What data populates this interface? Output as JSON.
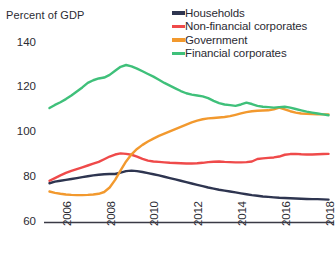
{
  "chart_data": {
    "type": "line",
    "title": "",
    "ylabel": "Percent of GDP",
    "xlabel": "",
    "ylim": [
      60,
      145
    ],
    "xlim": [
      2005.5,
      2018.75
    ],
    "yticks": [
      60,
      80,
      100,
      120,
      140
    ],
    "ytick_labels": [
      "60",
      "80",
      "100",
      "120",
      "140"
    ],
    "xticks": [
      2006,
      2008,
      2010,
      2012,
      2014,
      2016,
      2018
    ],
    "xtick_labels": [
      "2006",
      "2008",
      "2010",
      "2012",
      "2014",
      "2016",
      "2018"
    ],
    "grid": false,
    "legend_position": "top-right",
    "x": [
      2005.75,
      2006.0,
      2006.25,
      2006.5,
      2006.75,
      2007.0,
      2007.25,
      2007.5,
      2007.75,
      2008.0,
      2008.25,
      2008.5,
      2008.75,
      2009.0,
      2009.25,
      2009.5,
      2009.75,
      2010.0,
      2010.25,
      2010.5,
      2010.75,
      2011.0,
      2011.25,
      2011.5,
      2011.75,
      2012.0,
      2012.25,
      2012.5,
      2012.75,
      2013.0,
      2013.25,
      2013.5,
      2013.75,
      2014.0,
      2014.25,
      2014.5,
      2014.75,
      2015.0,
      2015.25,
      2015.5,
      2015.75,
      2016.0,
      2016.25,
      2016.5,
      2016.75,
      2017.0,
      2017.25,
      2017.5,
      2017.75,
      2018.0,
      2018.25,
      2018.5
    ],
    "series": [
      {
        "name": "Households",
        "color": "#2e3550",
        "values": [
          77.5,
          78.2,
          78.6,
          79.0,
          79.4,
          79.8,
          80.2,
          80.6,
          81.0,
          81.3,
          81.5,
          81.6,
          81.6,
          82.2,
          82.9,
          83.1,
          82.9,
          82.5,
          82.0,
          81.5,
          81.0,
          80.4,
          79.8,
          79.2,
          78.6,
          78.0,
          77.4,
          76.8,
          76.2,
          75.6,
          75.1,
          74.6,
          74.2,
          73.8,
          73.4,
          73.0,
          72.6,
          72.2,
          71.9,
          71.6,
          71.4,
          71.2,
          71.0,
          70.9,
          70.8,
          70.7,
          70.6,
          70.5,
          70.4,
          70.4,
          70.3,
          70.2
        ]
      },
      {
        "name": "Non-financial corporates",
        "color": "#ef4a4a",
        "values": [
          78.6,
          79.8,
          81.0,
          82.1,
          83.0,
          83.8,
          84.6,
          85.4,
          86.2,
          87.0,
          88.2,
          89.4,
          90.3,
          90.8,
          90.6,
          90.2,
          89.4,
          88.4,
          87.6,
          87.2,
          87.0,
          86.8,
          86.6,
          86.5,
          86.4,
          86.3,
          86.3,
          86.4,
          86.6,
          86.9,
          87.1,
          87.2,
          87.0,
          86.9,
          86.8,
          86.8,
          86.9,
          87.2,
          88.3,
          88.6,
          88.8,
          89.0,
          89.4,
          90.2,
          90.5,
          90.6,
          90.4,
          90.3,
          90.3,
          90.4,
          90.5,
          90.6
        ]
      },
      {
        "name": "Government",
        "color": "#f2992e",
        "values": [
          73.8,
          73.2,
          72.8,
          72.5,
          72.3,
          72.2,
          72.2,
          72.3,
          72.5,
          72.8,
          73.6,
          75.6,
          79.0,
          83.2,
          87.2,
          90.4,
          92.8,
          94.6,
          96.1,
          97.4,
          98.6,
          99.6,
          100.6,
          101.6,
          102.6,
          103.6,
          104.6,
          105.4,
          106.0,
          106.4,
          106.6,
          106.8,
          107.0,
          107.4,
          108.0,
          108.6,
          109.2,
          109.6,
          109.8,
          109.9,
          110.0,
          110.4,
          111.2,
          110.4,
          109.6,
          109.0,
          108.6,
          108.4,
          108.3,
          108.2,
          108.2,
          108.2
        ]
      },
      {
        "name": "Financial corporates",
        "color": "#3fc07a",
        "values": [
          111.0,
          112.4,
          113.6,
          115.0,
          116.6,
          118.4,
          120.2,
          122.2,
          123.4,
          124.2,
          124.6,
          125.8,
          127.6,
          129.4,
          130.2,
          129.6,
          128.6,
          127.4,
          126.2,
          125.0,
          123.6,
          122.2,
          121.0,
          119.8,
          118.6,
          117.6,
          117.0,
          116.6,
          116.2,
          115.4,
          114.2,
          113.2,
          112.6,
          112.3,
          112.0,
          112.6,
          113.4,
          112.8,
          112.0,
          111.6,
          111.4,
          111.2,
          111.4,
          111.6,
          111.2,
          110.6,
          110.0,
          109.4,
          109.0,
          108.6,
          108.2,
          107.8
        ]
      }
    ]
  },
  "legend": {
    "items": [
      {
        "label": "Households",
        "color": "#2e3550"
      },
      {
        "label": "Non-financial corporates",
        "color": "#ef4a4a"
      },
      {
        "label": "Government",
        "color": "#f2992e"
      },
      {
        "label": "Financial corporates",
        "color": "#3fc07a"
      }
    ]
  },
  "axis": {
    "y_title": "Percent of GDP"
  }
}
